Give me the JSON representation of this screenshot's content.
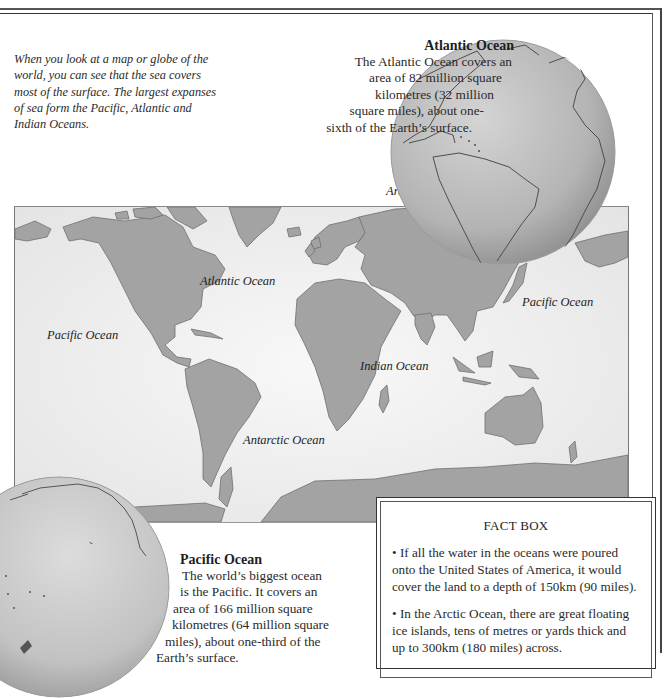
{
  "intro": {
    "text": "When you look at a map or globe of the world, you can see that the sea covers most of the surface. The largest expanses of sea form the Pacific, Atlantic and Indian Oceans."
  },
  "atlantic": {
    "title": "Atlantic Ocean",
    "body": "The Atlantic Ocean covers an area of 82 million square kilometres (32 million square miles), about one-sixth of the Earth’s surface.",
    "lines": [
      "The Atlantic Ocean covers an",
      "area of 82 million square",
      "kilometres (32 million",
      "square miles), about one-",
      "sixth of the Earth’s surface."
    ]
  },
  "pacific": {
    "title": "Pacific Ocean",
    "body": "The world’s biggest ocean is the Pacific. It covers an area of 166 million square kilometres (64 million square miles), about one-third of the Earth’s surface.",
    "lines": [
      "The world’s biggest ocean",
      "is the Pacific. It covers an",
      "area of 166 million square",
      "kilometres (64 million square",
      "miles), about one-third of the",
      "Earth’s surface."
    ]
  },
  "map": {
    "labels": {
      "arctic": "Arctic Ocean",
      "atlantic": "Atlantic Ocean",
      "pacific_west": "Pacific Ocean",
      "pacific_east": "Pacific Ocean",
      "indian": "Indian Ocean",
      "antarctic": "Antarctic Ocean"
    },
    "colors": {
      "land": "#9a9a9a",
      "sea": "#f2f2f2",
      "coast": "#6e6e6e"
    }
  },
  "fact_box": {
    "title": "FACT BOX",
    "items": [
      "• If all the water in the oceans were poured onto the United States of America, it would cover the land to a depth of 150km (90 miles).",
      "• In the Arctic Ocean, there are great floating ice islands, tens of metres or yards thick and up to 300km (180 miles) across."
    ]
  }
}
